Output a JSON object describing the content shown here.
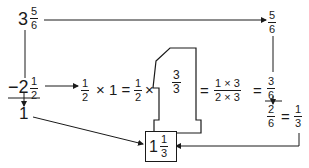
{
  "diagram": {
    "start": {
      "whole": "3",
      "num": "5",
      "den": "6"
    },
    "top_right": {
      "num": "5",
      "den": "6"
    },
    "subtract": {
      "sign": "−",
      "whole": "2",
      "num": "1",
      "den": "2"
    },
    "result_whole": "1",
    "equation": {
      "half": {
        "num": "1",
        "den": "2"
      },
      "times1": "× 1 =",
      "half2": {
        "num": "1",
        "den": "2"
      },
      "times2": "×",
      "three_thirds": {
        "num": "3",
        "den": "3"
      },
      "eq1": "=",
      "product": {
        "num": "1 × 3",
        "den": "2 × 3"
      },
      "eq2": "=",
      "three_sixths": {
        "num": "3",
        "den": "6"
      }
    },
    "diff": {
      "num": "2",
      "den": "6"
    },
    "eq3": "=",
    "simplified": {
      "num": "1",
      "den": "3"
    },
    "answer": {
      "whole": "1",
      "num": "1",
      "den": "3"
    },
    "colors": {
      "ink": "#1a1a1a",
      "background": "#ffffff"
    }
  }
}
